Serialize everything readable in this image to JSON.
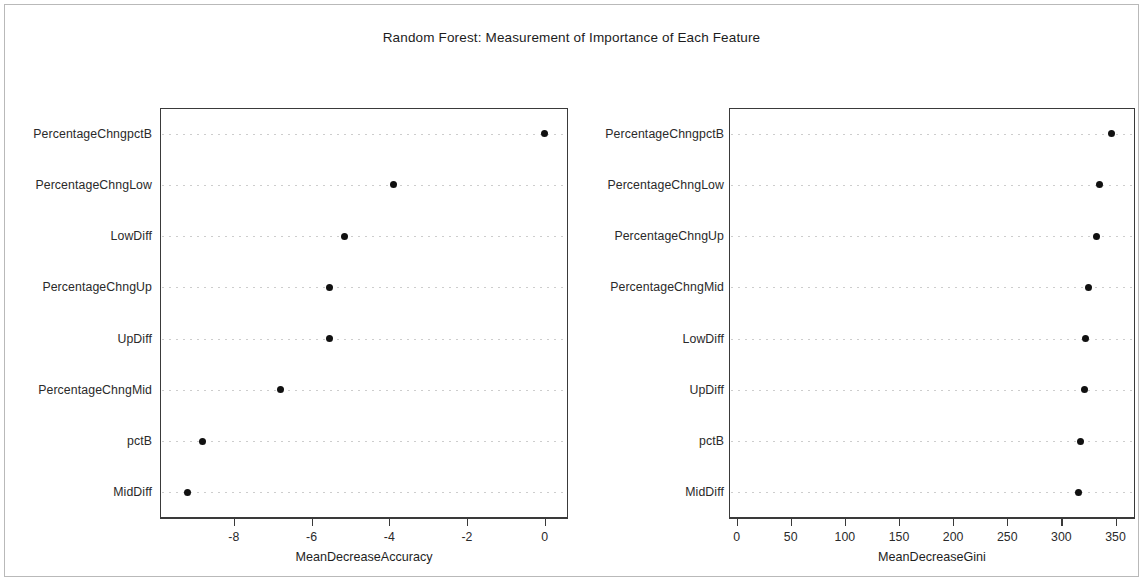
{
  "figure": {
    "title": "Random Forest: Measurement of Importance of Each Feature",
    "background_color": "#ffffff",
    "point_color": "#111111",
    "frame_color": "#3a3a3a"
  },
  "chart_data": [
    {
      "type": "scatter",
      "panel": "left",
      "title": "Random Forest: Measurement of Importance of Each Feature",
      "xlabel": "MeanDecreaseAccuracy",
      "ylabel": "",
      "xlim": [
        -9.9,
        0.6
      ],
      "xticks": [
        -8,
        -6,
        -4,
        -2,
        0
      ],
      "xticklabels": [
        "-8",
        "-6",
        "-4",
        "-2",
        "0"
      ],
      "grid": "dotted-horizontal",
      "legend": "none",
      "categories": [
        "PercentageChngpctB",
        "PercentageChngLow",
        "LowDiff",
        "PercentageChngUp",
        "UpDiff",
        "PercentageChngMid",
        "pctB",
        "MidDiff"
      ],
      "values": [
        0.0,
        -3.9,
        -5.15,
        -5.55,
        -5.55,
        -6.8,
        -8.8,
        -9.2
      ]
    },
    {
      "type": "scatter",
      "panel": "right",
      "title": "Random Forest: Measurement of Importance of Each Feature",
      "xlabel": "MeanDecreaseGini",
      "ylabel": "",
      "xlim": [
        -7,
        368
      ],
      "xticks": [
        0,
        50,
        100,
        150,
        200,
        250,
        300,
        350
      ],
      "xticklabels": [
        "0",
        "50",
        "100",
        "150",
        "200",
        "250",
        "300",
        "350"
      ],
      "grid": "dotted-horizontal",
      "legend": "none",
      "categories": [
        "PercentageChngpctB",
        "PercentageChngLow",
        "PercentageChngUp",
        "PercentageChngMid",
        "LowDiff",
        "UpDiff",
        "pctB",
        "MidDiff"
      ],
      "values": [
        346,
        335,
        332,
        325,
        322,
        321,
        318,
        316
      ]
    }
  ]
}
